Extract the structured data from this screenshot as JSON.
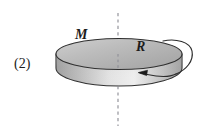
{
  "figure": {
    "index_label": "(2)",
    "mass_label": "M",
    "radius_label": "R",
    "axis_name": "rotation-axis",
    "body_shape": "solid-disk",
    "rotation_direction": "clockwise-viewed-from-above",
    "colors": {
      "ink": "#1c1c1c",
      "outline": "#2b2b2b",
      "top_face_light": "#d8d8d8",
      "top_face_dark": "#a8a8a8",
      "side_wall_light": "#efefef",
      "side_wall_dark": "#9a9a9a",
      "axis_dash": "#8a8a93",
      "background": "#ffffff"
    }
  }
}
